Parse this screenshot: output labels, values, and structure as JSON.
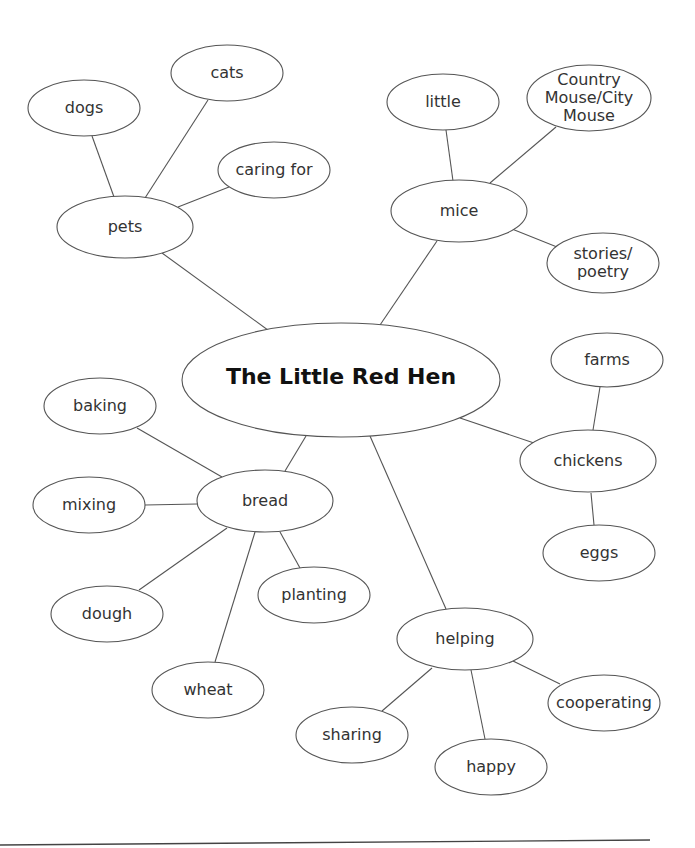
{
  "diagram": {
    "type": "concept-map",
    "center": {
      "id": "hen",
      "label": "The Little Red Hen",
      "cx": 341,
      "cy": 380,
      "rx": 159,
      "ry": 57
    },
    "nodes": [
      {
        "id": "pets",
        "label": "pets",
        "lines": [
          "pets"
        ],
        "cx": 125,
        "cy": 227,
        "rx": 68,
        "ry": 31
      },
      {
        "id": "dogs",
        "label": "dogs",
        "lines": [
          "dogs"
        ],
        "cx": 84,
        "cy": 108,
        "rx": 56,
        "ry": 28
      },
      {
        "id": "cats",
        "label": "cats",
        "lines": [
          "cats"
        ],
        "cx": 227,
        "cy": 73,
        "rx": 56,
        "ry": 28
      },
      {
        "id": "caring-for",
        "label": "caring for",
        "lines": [
          "caring for"
        ],
        "cx": 274,
        "cy": 170,
        "rx": 56,
        "ry": 28
      },
      {
        "id": "mice",
        "label": "mice",
        "lines": [
          "mice"
        ],
        "cx": 459,
        "cy": 211,
        "rx": 68,
        "ry": 31
      },
      {
        "id": "little",
        "label": "little",
        "lines": [
          "little"
        ],
        "cx": 443,
        "cy": 102,
        "rx": 56,
        "ry": 28
      },
      {
        "id": "country-mouse",
        "label": "Country Mouse/City Mouse",
        "lines": [
          "Country",
          "Mouse/City",
          "Mouse"
        ],
        "cx": 589,
        "cy": 98,
        "rx": 62,
        "ry": 33
      },
      {
        "id": "stories-poetry",
        "label": "stories/ poetry",
        "lines": [
          "stories/",
          "poetry"
        ],
        "cx": 603,
        "cy": 263,
        "rx": 56,
        "ry": 30
      },
      {
        "id": "bread",
        "label": "bread",
        "lines": [
          "bread"
        ],
        "cx": 265,
        "cy": 501,
        "rx": 68,
        "ry": 31
      },
      {
        "id": "baking",
        "label": "baking",
        "lines": [
          "baking"
        ],
        "cx": 100,
        "cy": 406,
        "rx": 56,
        "ry": 28
      },
      {
        "id": "mixing",
        "label": "mixing",
        "lines": [
          "mixing"
        ],
        "cx": 89,
        "cy": 505,
        "rx": 56,
        "ry": 28
      },
      {
        "id": "dough",
        "label": "dough",
        "lines": [
          "dough"
        ],
        "cx": 107,
        "cy": 614,
        "rx": 56,
        "ry": 28
      },
      {
        "id": "planting",
        "label": "planting",
        "lines": [
          "planting"
        ],
        "cx": 314,
        "cy": 595,
        "rx": 56,
        "ry": 28
      },
      {
        "id": "wheat",
        "label": "wheat",
        "lines": [
          "wheat"
        ],
        "cx": 208,
        "cy": 690,
        "rx": 56,
        "ry": 28
      },
      {
        "id": "chickens",
        "label": "chickens",
        "lines": [
          "chickens"
        ],
        "cx": 588,
        "cy": 461,
        "rx": 68,
        "ry": 31
      },
      {
        "id": "farms",
        "label": "farms",
        "lines": [
          "farms"
        ],
        "cx": 607,
        "cy": 360,
        "rx": 56,
        "ry": 27
      },
      {
        "id": "eggs",
        "label": "eggs",
        "lines": [
          "eggs"
        ],
        "cx": 599,
        "cy": 553,
        "rx": 56,
        "ry": 28
      },
      {
        "id": "helping",
        "label": "helping",
        "lines": [
          "helping"
        ],
        "cx": 465,
        "cy": 639,
        "rx": 68,
        "ry": 31
      },
      {
        "id": "cooperating",
        "label": "cooperating",
        "lines": [
          "cooperating"
        ],
        "cx": 604,
        "cy": 703,
        "rx": 56,
        "ry": 28
      },
      {
        "id": "sharing",
        "label": "sharing",
        "lines": [
          "sharing"
        ],
        "cx": 352,
        "cy": 735,
        "rx": 56,
        "ry": 28
      },
      {
        "id": "happy",
        "label": "happy",
        "lines": [
          "happy"
        ],
        "cx": 491,
        "cy": 767,
        "rx": 56,
        "ry": 28
      }
    ],
    "edges": [
      {
        "from": "hen",
        "to": "pets",
        "x1": 272,
        "y1": 333,
        "x2": 162,
        "y2": 253
      },
      {
        "from": "hen",
        "to": "mice",
        "x1": 380,
        "y1": 325,
        "x2": 437,
        "y2": 241
      },
      {
        "from": "hen",
        "to": "bread",
        "x1": 306,
        "y1": 436,
        "x2": 285,
        "y2": 471
      },
      {
        "from": "hen",
        "to": "chickens",
        "x1": 460,
        "y1": 418,
        "x2": 534,
        "y2": 443
      },
      {
        "from": "hen",
        "to": "helping",
        "x1": 370,
        "y1": 436,
        "x2": 446,
        "y2": 609
      },
      {
        "from": "pets",
        "to": "dogs",
        "x1": 114,
        "y1": 197,
        "x2": 92,
        "y2": 136
      },
      {
        "from": "pets",
        "to": "cats",
        "x1": 145,
        "y1": 198,
        "x2": 208,
        "y2": 100
      },
      {
        "from": "pets",
        "to": "caring-for",
        "x1": 178,
        "y1": 207,
        "x2": 229,
        "y2": 187
      },
      {
        "from": "mice",
        "to": "little",
        "x1": 453,
        "y1": 181,
        "x2": 446,
        "y2": 130
      },
      {
        "from": "mice",
        "to": "country-mouse",
        "x1": 490,
        "y1": 183,
        "x2": 556,
        "y2": 127
      },
      {
        "from": "mice",
        "to": "stories-poetry",
        "x1": 512,
        "y1": 229,
        "x2": 557,
        "y2": 247
      },
      {
        "from": "bread",
        "to": "baking",
        "x1": 222,
        "y1": 477,
        "x2": 137,
        "y2": 428
      },
      {
        "from": "bread",
        "to": "mixing",
        "x1": 197,
        "y1": 504,
        "x2": 145,
        "y2": 505
      },
      {
        "from": "bread",
        "to": "dough",
        "x1": 227,
        "y1": 528,
        "x2": 139,
        "y2": 590
      },
      {
        "from": "bread",
        "to": "planting",
        "x1": 280,
        "y1": 532,
        "x2": 300,
        "y2": 568
      },
      {
        "from": "bread",
        "to": "wheat",
        "x1": 255,
        "y1": 532,
        "x2": 215,
        "y2": 662
      },
      {
        "from": "chickens",
        "to": "farms",
        "x1": 593,
        "y1": 430,
        "x2": 600,
        "y2": 387
      },
      {
        "from": "chickens",
        "to": "eggs",
        "x1": 591,
        "y1": 493,
        "x2": 594,
        "y2": 525
      },
      {
        "from": "helping",
        "to": "cooperating",
        "x1": 513,
        "y1": 661,
        "x2": 560,
        "y2": 684
      },
      {
        "from": "helping",
        "to": "sharing",
        "x1": 432,
        "y1": 668,
        "x2": 382,
        "y2": 711
      },
      {
        "from": "helping",
        "to": "happy",
        "x1": 471,
        "y1": 670,
        "x2": 485,
        "y2": 739
      }
    ],
    "footer_rule": {
      "x1": 0,
      "y1": 845,
      "x2": 650,
      "y2": 840
    }
  }
}
